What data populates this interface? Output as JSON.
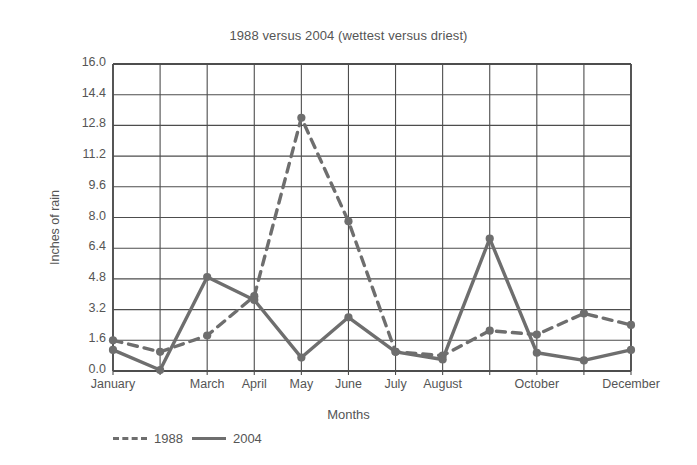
{
  "chart_data": {
    "type": "line",
    "title": "1988 versus 2004 (wettest versus driest)",
    "xlabel": "Months",
    "ylabel": "Inches of rain",
    "grid": true,
    "legend_position": "bottom-left",
    "ylim": [
      0.0,
      16.0
    ],
    "ytick_labels": [
      "0.0",
      "1.6",
      "3.2",
      "4.8",
      "6.4",
      "8.0",
      "9.6",
      "11.2",
      "12.8",
      "14.4",
      "16.0"
    ],
    "ytick_values": [
      0.0,
      1.6,
      3.2,
      4.8,
      6.4,
      8.0,
      9.6,
      11.2,
      12.8,
      14.4,
      16.0
    ],
    "categories": [
      "January",
      "February",
      "March",
      "April",
      "May",
      "June",
      "July",
      "August",
      "September",
      "October",
      "November",
      "December"
    ],
    "visible_xtick_labels": [
      "January",
      "",
      "March",
      "April",
      "May",
      "June",
      "July",
      "August",
      "",
      "October",
      "",
      "December"
    ],
    "series": [
      {
        "name": "1988",
        "style": "dashed",
        "color": "#6e6e6e",
        "values": [
          1.6,
          1.0,
          1.85,
          3.9,
          13.2,
          7.8,
          1.0,
          0.8,
          2.1,
          1.9,
          3.0,
          2.4
        ]
      },
      {
        "name": "2004",
        "style": "solid",
        "color": "#6e6e6e",
        "values": [
          1.1,
          0.05,
          4.9,
          3.7,
          0.7,
          2.8,
          1.0,
          0.6,
          6.9,
          0.95,
          0.55,
          1.1
        ]
      }
    ]
  },
  "legend": {
    "items": [
      {
        "label": "1988",
        "style": "dashed"
      },
      {
        "label": "2004",
        "style": "solid"
      }
    ]
  }
}
